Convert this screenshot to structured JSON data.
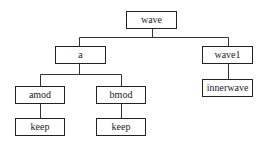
{
  "diagram": {
    "type": "tree",
    "nodes": [
      {
        "id": "wave",
        "label": "wave",
        "x": 126,
        "y": 11,
        "w": 51
      },
      {
        "id": "a",
        "label": "a",
        "x": 55,
        "y": 46,
        "w": 51
      },
      {
        "id": "wave1",
        "label": "wave1",
        "x": 202,
        "y": 46,
        "w": 51
      },
      {
        "id": "amod",
        "label": "amod",
        "x": 15,
        "y": 86,
        "w": 50
      },
      {
        "id": "bmod",
        "label": "bmod",
        "x": 96,
        "y": 86,
        "w": 50
      },
      {
        "id": "innerwave",
        "label": "innerwave",
        "x": 202,
        "y": 79,
        "w": 51
      },
      {
        "id": "keep1",
        "label": "keep",
        "x": 15,
        "y": 118,
        "w": 50
      },
      {
        "id": "keep2",
        "label": "keep",
        "x": 96,
        "y": 118,
        "w": 50
      }
    ],
    "edges": [
      [
        "wave",
        "a"
      ],
      [
        "wave",
        "wave1"
      ],
      [
        "a",
        "amod"
      ],
      [
        "a",
        "bmod"
      ],
      [
        "wave1",
        "innerwave"
      ],
      [
        "amod",
        "keep1"
      ],
      [
        "bmod",
        "keep2"
      ]
    ],
    "line_color": "#333333"
  }
}
